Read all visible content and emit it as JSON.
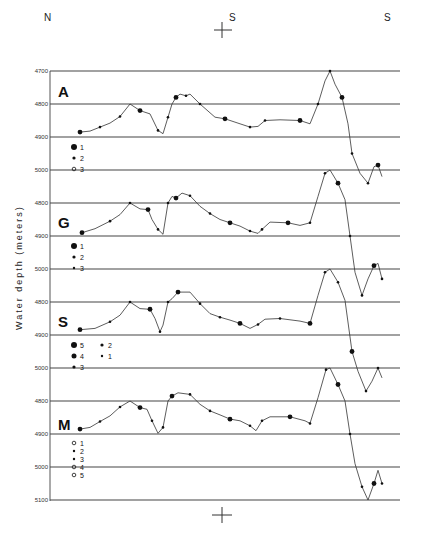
{
  "chart_data": {
    "type": "line",
    "title": "",
    "xlabel": "",
    "ylabel": "Water depth (meters)",
    "orientation_labels": {
      "left": "N",
      "center": "S",
      "right": "S"
    },
    "grid": true,
    "panels": [
      {
        "label": "A",
        "yticks": [
          4700,
          4800,
          4900,
          5000
        ],
        "ylim": [
          5000,
          4700
        ],
        "legend": [
          {
            "symbol": "large-filled-circle",
            "label": "1"
          },
          {
            "symbol": "small-filled-circle",
            "label": "2"
          },
          {
            "symbol": "open-circle",
            "label": "3"
          }
        ],
        "profile": [
          [
            80,
            4885
          ],
          [
            90,
            4882
          ],
          [
            100,
            4870
          ],
          [
            110,
            4858
          ],
          [
            120,
            4838
          ],
          [
            130,
            4800
          ],
          [
            140,
            4820
          ],
          [
            150,
            4830
          ],
          [
            158,
            4880
          ],
          [
            163,
            4890
          ],
          [
            168,
            4840
          ],
          [
            172,
            4800
          ],
          [
            176,
            4780
          ],
          [
            180,
            4770
          ],
          [
            186,
            4775
          ],
          [
            190,
            4770
          ],
          [
            200,
            4800
          ],
          [
            215,
            4840
          ],
          [
            225,
            4845
          ],
          [
            240,
            4860
          ],
          [
            250,
            4870
          ],
          [
            258,
            4868
          ],
          [
            265,
            4850
          ],
          [
            280,
            4848
          ],
          [
            300,
            4850
          ],
          [
            310,
            4860
          ],
          [
            318,
            4800
          ],
          [
            325,
            4730
          ],
          [
            330,
            4700
          ],
          [
            335,
            4740
          ],
          [
            342,
            4780
          ],
          [
            348,
            4860
          ],
          [
            352,
            4950
          ],
          [
            360,
            5010
          ],
          [
            368,
            5040
          ],
          [
            374,
            4990
          ],
          [
            378,
            4985
          ],
          [
            382,
            5020
          ]
        ]
      },
      {
        "label": "G",
        "yticks": [
          4800,
          4900,
          5000
        ],
        "ylim": [
          5000,
          4700
        ],
        "legend": [
          {
            "symbol": "large-filled-circle",
            "label": "1"
          },
          {
            "symbol": "small-filled-circle",
            "label": "2"
          },
          {
            "symbol": "dot",
            "label": "3"
          }
        ],
        "profile": [
          [
            82,
            4890
          ],
          [
            95,
            4878
          ],
          [
            110,
            4855
          ],
          [
            120,
            4835
          ],
          [
            130,
            4800
          ],
          [
            140,
            4818
          ],
          [
            148,
            4820
          ],
          [
            152,
            4850
          ],
          [
            158,
            4880
          ],
          [
            163,
            4895
          ],
          [
            168,
            4800
          ],
          [
            172,
            4780
          ],
          [
            176,
            4785
          ],
          [
            182,
            4770
          ],
          [
            190,
            4778
          ],
          [
            200,
            4810
          ],
          [
            210,
            4832
          ],
          [
            220,
            4850
          ],
          [
            230,
            4860
          ],
          [
            240,
            4870
          ],
          [
            250,
            4885
          ],
          [
            258,
            4892
          ],
          [
            262,
            4880
          ],
          [
            270,
            4858
          ],
          [
            288,
            4860
          ],
          [
            300,
            4868
          ],
          [
            310,
            4860
          ],
          [
            318,
            4780
          ],
          [
            325,
            4710
          ],
          [
            330,
            4700
          ],
          [
            338,
            4740
          ],
          [
            345,
            4790
          ],
          [
            350,
            4900
          ],
          [
            355,
            5010
          ],
          [
            362,
            5080
          ],
          [
            368,
            5030
          ],
          [
            374,
            4990
          ],
          [
            378,
            4983
          ],
          [
            382,
            5030
          ]
        ]
      },
      {
        "label": "S",
        "yticks": [
          4800,
          4900,
          5000
        ],
        "ylim": [
          5000,
          4700
        ],
        "legend": [
          {
            "symbol": "large-filled-circle",
            "label": "5"
          },
          {
            "symbol": "medium-filled-circle",
            "label": "4"
          },
          {
            "symbol": "small-filled-circle",
            "label": "3"
          },
          {
            "symbol": "small-dot",
            "label": "2"
          },
          {
            "symbol": "tiny-dot",
            "label": "1"
          }
        ],
        "profile": [
          [
            80,
            4884
          ],
          [
            95,
            4880
          ],
          [
            110,
            4860
          ],
          [
            120,
            4840
          ],
          [
            130,
            4800
          ],
          [
            140,
            4820
          ],
          [
            150,
            4822
          ],
          [
            155,
            4850
          ],
          [
            160,
            4890
          ],
          [
            163,
            4870
          ],
          [
            168,
            4800
          ],
          [
            172,
            4790
          ],
          [
            178,
            4770
          ],
          [
            190,
            4770
          ],
          [
            200,
            4805
          ],
          [
            210,
            4835
          ],
          [
            220,
            4846
          ],
          [
            230,
            4855
          ],
          [
            240,
            4865
          ],
          [
            250,
            4880
          ],
          [
            258,
            4868
          ],
          [
            265,
            4852
          ],
          [
            280,
            4850
          ],
          [
            300,
            4858
          ],
          [
            310,
            4865
          ],
          [
            318,
            4780
          ],
          [
            325,
            4710
          ],
          [
            330,
            4700
          ],
          [
            338,
            4740
          ],
          [
            345,
            4795
          ],
          [
            352,
            4950
          ],
          [
            358,
            5010
          ],
          [
            366,
            5070
          ],
          [
            372,
            5040
          ],
          [
            378,
            5000
          ],
          [
            382,
            5030
          ]
        ]
      },
      {
        "label": "M",
        "yticks": [
          4800,
          4900,
          5000,
          5100
        ],
        "ylim": [
          5100,
          4700
        ],
        "legend": [
          {
            "symbol": "open-square",
            "label": "1"
          },
          {
            "symbol": "triangle",
            "label": "2"
          },
          {
            "symbol": "half-circle",
            "label": "3"
          },
          {
            "symbol": "double-circle",
            "label": "4"
          },
          {
            "symbol": "open-oval",
            "label": "5"
          }
        ],
        "profile": [
          [
            80,
            4885
          ],
          [
            90,
            4880
          ],
          [
            100,
            4862
          ],
          [
            110,
            4845
          ],
          [
            120,
            4818
          ],
          [
            130,
            4800
          ],
          [
            140,
            4820
          ],
          [
            147,
            4825
          ],
          [
            152,
            4860
          ],
          [
            158,
            4898
          ],
          [
            163,
            4880
          ],
          [
            168,
            4800
          ],
          [
            172,
            4785
          ],
          [
            178,
            4775
          ],
          [
            190,
            4780
          ],
          [
            200,
            4810
          ],
          [
            210,
            4830
          ],
          [
            220,
            4842
          ],
          [
            230,
            4855
          ],
          [
            240,
            4860
          ],
          [
            250,
            4875
          ],
          [
            256,
            4890
          ],
          [
            262,
            4860
          ],
          [
            270,
            4848
          ],
          [
            290,
            4848
          ],
          [
            305,
            4860
          ],
          [
            310,
            4868
          ],
          [
            318,
            4790
          ],
          [
            326,
            4705
          ],
          [
            330,
            4700
          ],
          [
            338,
            4750
          ],
          [
            345,
            4800
          ],
          [
            350,
            4900
          ],
          [
            355,
            4990
          ],
          [
            362,
            5060
          ],
          [
            368,
            5100
          ],
          [
            374,
            5050
          ],
          [
            378,
            5010
          ],
          [
            382,
            5050
          ]
        ]
      }
    ],
    "x_axis_marks": [
      "top cross at center",
      "bottom cross at center"
    ]
  }
}
